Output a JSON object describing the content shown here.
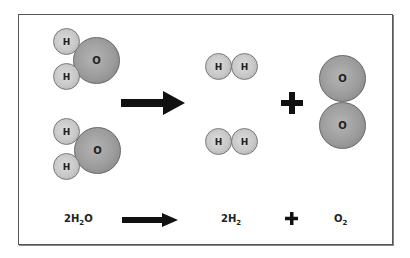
{
  "diagram": {
    "reactants": {
      "molecules": [
        {
          "name": "water-molecule-1",
          "atoms": [
            {
              "symbol": "H"
            },
            {
              "symbol": "H"
            },
            {
              "symbol": "O"
            }
          ]
        },
        {
          "name": "water-molecule-2",
          "atoms": [
            {
              "symbol": "H"
            },
            {
              "symbol": "H"
            },
            {
              "symbol": "O"
            }
          ]
        }
      ]
    },
    "products": {
      "hydrogen": [
        {
          "name": "hydrogen-molecule-1",
          "atoms": [
            {
              "symbol": "H"
            },
            {
              "symbol": "H"
            }
          ]
        },
        {
          "name": "hydrogen-molecule-2",
          "atoms": [
            {
              "symbol": "H"
            },
            {
              "symbol": "H"
            }
          ]
        }
      ],
      "oxygen": {
        "name": "oxygen-molecule",
        "atoms": [
          {
            "symbol": "O"
          },
          {
            "symbol": "O"
          }
        ]
      }
    },
    "equation": {
      "reactant_coef": "2",
      "reactant_h": "H",
      "reactant_h_sub": "2",
      "reactant_o": "O",
      "product1_coef": "2",
      "product1_h": "H",
      "product1_h_sub": "2",
      "plus": "+",
      "product2_o": "O",
      "product2_o_sub": "2"
    },
    "colors": {
      "hydrogen_atom": "#c8c8c8",
      "oxygen_atom": "#9c9c9c",
      "arrow": "#111111",
      "border": "#555555"
    }
  }
}
